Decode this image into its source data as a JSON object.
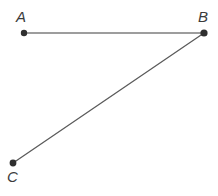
{
  "figure": {
    "title": "",
    "width": 218,
    "height": 196,
    "background_color": "#ffffff"
  },
  "diagram": {
    "type": "geometric-line-figure",
    "stroke_color": "#7d7d7d",
    "segment_bc_color": "#5b5b5b",
    "point_color": "#2f2f2f",
    "label_color": "#3b3b3b",
    "points": [
      {
        "name": "A",
        "label": "A",
        "x": 24,
        "y": 33,
        "radius": 3.2
      },
      {
        "name": "B",
        "label": "B",
        "x": 204,
        "y": 33,
        "radius": 3.6
      },
      {
        "name": "C",
        "label": "C",
        "x": 13,
        "y": 163,
        "radius": 3.4
      }
    ],
    "segments": [
      {
        "name": "segment-AB",
        "from": "A",
        "to": "B",
        "x1": 24,
        "y1": 33,
        "x2": 204,
        "y2": 33,
        "width": 1.4
      },
      {
        "name": "segment-BC",
        "from": "B",
        "to": "C",
        "x1": 204,
        "y1": 33,
        "x2": 13,
        "y2": 163,
        "width": 1.3
      }
    ],
    "labels": {
      "a": "A",
      "b": "B",
      "c": "C"
    }
  }
}
